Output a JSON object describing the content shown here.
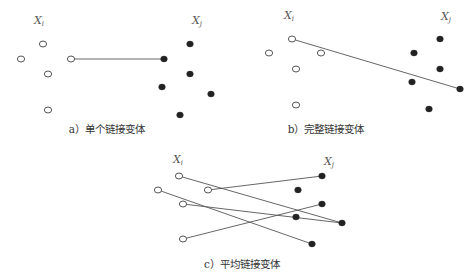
{
  "panels": [
    {
      "id": "a",
      "caption": "a）单个链接变体",
      "caption_pos": [
        107,
        133
      ],
      "cluster_i_label": "X",
      "cluster_i_sub": "i",
      "label_i_pos": [
        34,
        24
      ],
      "cluster_j_label": "X",
      "cluster_j_sub": "j",
      "label_j_pos": [
        192,
        24
      ],
      "open_points": [
        [
          43,
          44
        ],
        [
          21,
          59
        ],
        [
          71,
          59
        ],
        [
          48,
          74
        ],
        [
          48,
          110
        ]
      ],
      "filled_points": [
        [
          190,
          44
        ],
        [
          164,
          59
        ],
        [
          190,
          74
        ],
        [
          162,
          87
        ],
        [
          211,
          94
        ],
        [
          180,
          115
        ]
      ],
      "links": [
        [
          [
            71,
            59
          ],
          [
            164,
            59
          ]
        ]
      ]
    },
    {
      "id": "b",
      "caption": "b）完整链接变体",
      "caption_pos": [
        326,
        133
      ],
      "cluster_i_label": "X",
      "cluster_i_sub": "i",
      "label_i_pos": [
        284,
        19
      ],
      "cluster_j_label": "X",
      "cluster_j_sub": "j",
      "label_j_pos": [
        441,
        20
      ],
      "open_points": [
        [
          292,
          39
        ],
        [
          269,
          53
        ],
        [
          321,
          53
        ],
        [
          296,
          69
        ],
        [
          296,
          105
        ]
      ],
      "filled_points": [
        [
          440,
          39
        ],
        [
          414,
          53
        ],
        [
          440,
          69
        ],
        [
          412,
          82
        ],
        [
          460,
          89
        ],
        [
          429,
          109
        ]
      ],
      "links": [
        [
          [
            292,
            39
          ],
          [
            460,
            89
          ]
        ]
      ]
    },
    {
      "id": "c",
      "caption": "c）平均链接变体",
      "caption_pos": [
        242,
        268
      ],
      "cluster_i_label": "X",
      "cluster_i_sub": "i",
      "label_i_pos": [
        173,
        163
      ],
      "cluster_j_label": "X",
      "cluster_j_sub": "j",
      "label_j_pos": [
        324,
        165
      ],
      "open_points": [
        [
          179,
          176
        ],
        [
          158,
          190
        ],
        [
          208,
          190
        ],
        [
          183,
          204
        ],
        [
          183,
          239
        ]
      ],
      "filled_points": [
        [
          322,
          176
        ],
        [
          298,
          190
        ],
        [
          322,
          204
        ],
        [
          296,
          217
        ],
        [
          342,
          223
        ],
        [
          312,
          244
        ]
      ],
      "links": [
        [
          [
            179,
            176
          ],
          [
            342,
            223
          ]
        ],
        [
          [
            208,
            190
          ],
          [
            322,
            176
          ]
        ],
        [
          [
            158,
            190
          ],
          [
            312,
            244
          ]
        ],
        [
          [
            183,
            204
          ],
          [
            342,
            223
          ]
        ],
        [
          [
            183,
            239
          ],
          [
            322,
            204
          ]
        ]
      ]
    }
  ]
}
